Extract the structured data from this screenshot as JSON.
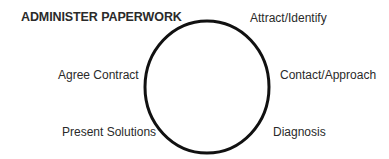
{
  "diagram": {
    "type": "cycle",
    "title": "ADMINISTER PAPERWORK",
    "stages": [
      {
        "label": "Attract/Identify"
      },
      {
        "label": "Contact/Approach"
      },
      {
        "label": "Diagnosis"
      },
      {
        "label": "Present Solutions"
      },
      {
        "label": "Agree Contract"
      }
    ],
    "colors": {
      "stroke": "#111111",
      "text": "#2a2a2a",
      "background": "#ffffff"
    }
  }
}
